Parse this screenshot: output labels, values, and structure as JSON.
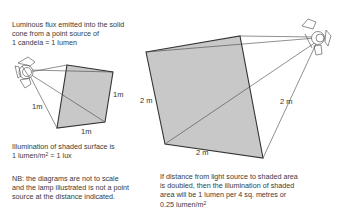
{
  "top_left_caption": {
    "line1": "Luminous flux emitted into the solid",
    "line2": "cone from a point source of",
    "line3": "1 candela = 1 lumen"
  },
  "small_diagram": {
    "side_left_label": "1m",
    "side_right_label": "1m",
    "side_bottom_label": "1m",
    "fill_color": "#c8c8c8"
  },
  "illumination_caption": {
    "line1": "Illumination of shaded surface is",
    "line2_prefix": "1 lumen/m",
    "line2_sup": "2",
    "line2_suffix": " = 1 lux"
  },
  "note_caption": {
    "line1": "NB: the diagrams are not to scale",
    "line2": "and the lamp illustrated is not a point",
    "line3": "source at the distance indicated."
  },
  "large_diagram": {
    "side_left_label": "2 m",
    "side_right_label": "2 m",
    "side_bottom_label": "2 m",
    "fill_color": "#c8c8c8"
  },
  "doubled_caption": {
    "line1": "If distance from light source to shaded area",
    "line2": "is doubled, then the illumination of shaded",
    "line3": "area will be 1 lumen per 4 sq. metres or",
    "line4_prefix": "0.25 lumen/m",
    "line4_sup": "2"
  },
  "icons": {
    "left_lamp": "spotlight-lamp-icon",
    "right_lamp": "spotlight-lamp-icon"
  }
}
